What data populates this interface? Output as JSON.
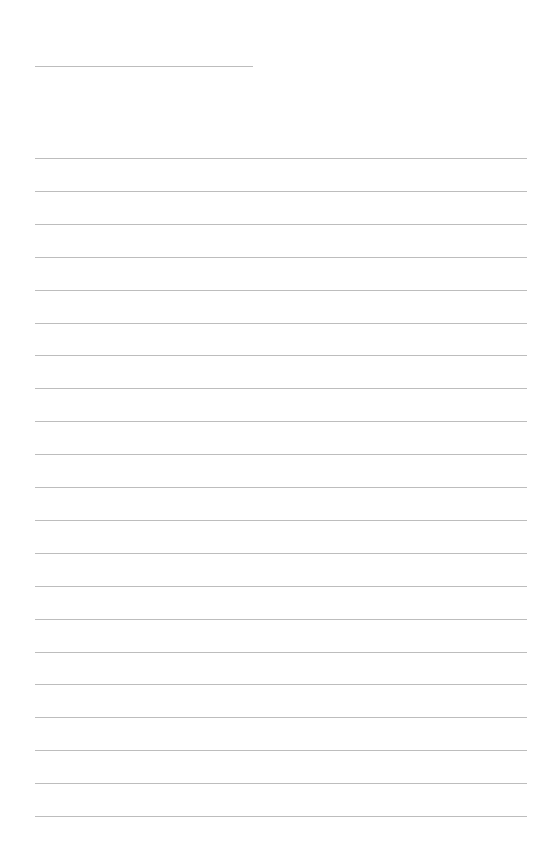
{
  "page": {
    "type": "blank lined paper",
    "background_color": "#ffffff",
    "line_color": "#bdbdbd"
  },
  "title_line": {
    "x": 35,
    "y": 66,
    "width": 218
  },
  "ruled_lines": {
    "count": 21,
    "x": 35,
    "width": 492,
    "first_y": 158,
    "spacing": 32.9
  }
}
